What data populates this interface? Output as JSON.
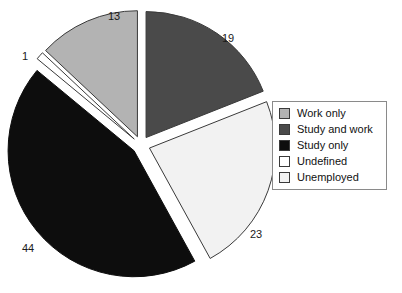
{
  "chart_data": {
    "type": "pie",
    "title": "",
    "subtitle": "",
    "xlabel": "",
    "ylabel": "",
    "grid": false,
    "legend_position": "right",
    "exploded": true,
    "start_angle_deg": 0,
    "direction": "clockwise",
    "categories": [
      "Work only",
      "Study and work",
      "Study only",
      "Undefined",
      "Unemployed"
    ],
    "values": [
      13,
      19,
      44,
      1,
      23
    ],
    "total": 100,
    "slices": [
      {
        "label": "Work only",
        "value": 13,
        "value_text": "13",
        "color": "#b3b3b3",
        "stroke": "#3a3a3a",
        "label_x": 108,
        "label_y": 20
      },
      {
        "label": "Study and work",
        "value": 19,
        "value_text": "19",
        "color": "#4a4a4a",
        "stroke": "#3a3a3a",
        "label_x": 222,
        "label_y": 42
      },
      {
        "label": "Study only",
        "value": 44,
        "value_text": "44",
        "color": "#0d0d0d",
        "stroke": "#0d0d0d",
        "label_x": 22,
        "label_y": 252
      },
      {
        "label": "Undefined",
        "value": 1,
        "value_text": "1",
        "color": "#ffffff",
        "stroke": "#3a3a3a",
        "label_x": 22,
        "label_y": 60
      },
      {
        "label": "Unemployed",
        "value": 23,
        "value_text": "23",
        "color": "#f2f2f2",
        "stroke": "#3a3a3a",
        "label_x": 250,
        "label_y": 238
      }
    ]
  },
  "legend": {
    "border_color": "#8a8a8a",
    "items": [
      {
        "label": "Work only",
        "color": "#b3b3b3"
      },
      {
        "label": "Study and work",
        "color": "#4a4a4a"
      },
      {
        "label": "Study only",
        "color": "#0d0d0d"
      },
      {
        "label": "Undefined",
        "color": "#ffffff"
      },
      {
        "label": "Unemployed",
        "color": "#f2f2f2"
      }
    ]
  }
}
